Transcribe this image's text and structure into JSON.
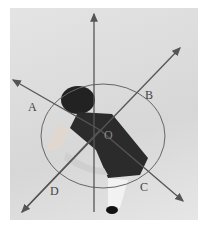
{
  "figure": {
    "labels": {
      "a": "A",
      "b": "B",
      "c": "C",
      "d": "D",
      "o": "O"
    },
    "colors": {
      "line": "#555555",
      "background": "#dcdcdc",
      "figure_dark": "#2a2a2a"
    }
  }
}
